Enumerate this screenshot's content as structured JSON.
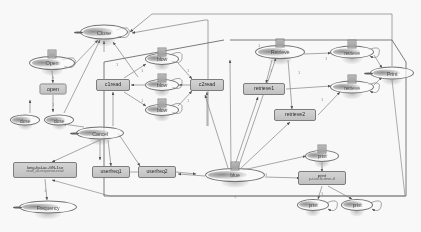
{
  "diagram": {
    "background": "#fdfdfd",
    "node_fill_box": "#cccccc",
    "node_stroke": "#6e6e6e",
    "edge_color": "#7d7d7d",
    "frame_color": "#5f5f5f"
  },
  "nodes": [
    {
      "id": "close_top",
      "label": "Close",
      "shape": "ellipse",
      "dot": true,
      "x": 104,
      "y": 32,
      "w": 48,
      "h": 15,
      "fs": 6.0
    },
    {
      "id": "open_ell",
      "label": "Open",
      "shape": "ellipse",
      "dot": false,
      "x": 52,
      "y": 63,
      "w": 46,
      "h": 14,
      "fs": 5.6
    },
    {
      "id": "open_box",
      "label": "open",
      "shape": "box",
      "x": 53,
      "y": 89,
      "w": 27,
      "h": 11,
      "fs": 5.4
    },
    {
      "id": "close_ell1",
      "label": "close",
      "shape": "ellipse",
      "dot": false,
      "x": 25,
      "y": 120,
      "w": 30,
      "h": 11,
      "fs": 5.0
    },
    {
      "id": "close_ell2",
      "label": "close",
      "shape": "ellipse",
      "dot": false,
      "x": 59,
      "y": 120,
      "w": 30,
      "h": 11,
      "fs": 5.0
    },
    {
      "id": "c1read",
      "label": "c1read",
      "shape": "box",
      "x": 113,
      "y": 85,
      "w": 34,
      "h": 12,
      "fs": 5.4
    },
    {
      "id": "blow_top",
      "label": "blow",
      "shape": "ellipse",
      "dot": false,
      "x": 162,
      "y": 59,
      "w": 34,
      "h": 12,
      "fs": 5.2
    },
    {
      "id": "blow_mid",
      "label": "blow",
      "shape": "ellipse",
      "dot": false,
      "x": 162,
      "y": 85,
      "w": 34,
      "h": 12,
      "fs": 5.2
    },
    {
      "id": "blow_bot",
      "label": "blow",
      "shape": "ellipse",
      "dot": false,
      "x": 162,
      "y": 110,
      "w": 34,
      "h": 12,
      "fs": 5.2
    },
    {
      "id": "c2read",
      "label": "c2read",
      "shape": "box",
      "x": 207,
      "y": 85,
      "w": 34,
      "h": 12,
      "fs": 5.4
    },
    {
      "id": "cancel_hub",
      "label": "Cancel",
      "shape": "ellipse",
      "dot": true,
      "x": 100,
      "y": 133,
      "w": 48,
      "h": 13,
      "fs": 5.4
    },
    {
      "id": "retrieve_e",
      "label": "Retrieve",
      "shape": "ellipse",
      "dot": false,
      "x": 280,
      "y": 52,
      "w": 50,
      "h": 14,
      "fs": 5.4
    },
    {
      "id": "retrieve1",
      "label": "retrieve1",
      "shape": "box",
      "x": 264,
      "y": 89,
      "w": 42,
      "h": 12,
      "fs": 5.2
    },
    {
      "id": "retrieve2",
      "label": "retrieve2",
      "shape": "box",
      "x": 295,
      "y": 115,
      "w": 42,
      "h": 12,
      "fs": 5.2
    },
    {
      "id": "retrieve_r1",
      "label": "retrieve",
      "shape": "ellipse",
      "dot": false,
      "x": 352,
      "y": 52,
      "w": 44,
      "h": 13,
      "fs": 5.2
    },
    {
      "id": "retrieve_r2",
      "label": "retrieve",
      "shape": "ellipse",
      "dot": false,
      "x": 352,
      "y": 87,
      "w": 44,
      "h": 13,
      "fs": 5.2
    },
    {
      "id": "print_ell",
      "label": "Print",
      "shape": "ellipse",
      "dot": true,
      "x": 392,
      "y": 73,
      "w": 44,
      "h": 13,
      "fs": 5.6
    },
    {
      "id": "blue_hub",
      "label": "blue",
      "shape": "ellipse",
      "dot": false,
      "x": 235,
      "y": 175,
      "w": 60,
      "h": 14,
      "fs": 5.4
    },
    {
      "id": "getfreq_box",
      "label": "long-hal-ac-GN-1se",
      "label2": "read_all-response-read",
      "shape": "box",
      "x": 45,
      "y": 170,
      "w": 64,
      "h": 16,
      "fs": 4.2
    },
    {
      "id": "frequency",
      "label": "Frequency",
      "shape": "ellipse",
      "dot": true,
      "x": 48,
      "y": 207,
      "w": 58,
      "h": 13,
      "fs": 5.2
    },
    {
      "id": "usefreq1",
      "label": "userfreq1",
      "shape": "box",
      "x": 111,
      "y": 172,
      "w": 38,
      "h": 12,
      "fs": 5.0
    },
    {
      "id": "usefreq2",
      "label": "userfreq2",
      "shape": "box",
      "x": 157,
      "y": 172,
      "w": 38,
      "h": 12,
      "fs": 5.0
    },
    {
      "id": "print_up",
      "label": "print",
      "shape": "ellipse",
      "dot": false,
      "x": 322,
      "y": 156,
      "w": 34,
      "h": 12,
      "fs": 5.0
    },
    {
      "id": "print_box",
      "label": "print",
      "label2": "p-t-raf-fit-timer-tf",
      "shape": "box",
      "x": 322,
      "y": 178,
      "w": 48,
      "h": 14,
      "fs": 4.4
    },
    {
      "id": "print_d1",
      "label": "print",
      "shape": "ellipse",
      "dot": false,
      "x": 313,
      "y": 205,
      "w": 32,
      "h": 12,
      "fs": 5.0
    },
    {
      "id": "print_d2",
      "label": "print",
      "shape": "ellipse",
      "dot": false,
      "x": 357,
      "y": 205,
      "w": 32,
      "h": 12,
      "fs": 5.0
    }
  ],
  "edge_labels": [
    {
      "text": "1",
      "x": 53,
      "y": 77
    },
    {
      "text": "1",
      "x": 53,
      "y": 104
    },
    {
      "text": "1",
      "x": 117,
      "y": 64
    },
    {
      "text": "1",
      "x": 142,
      "y": 70
    },
    {
      "text": "1",
      "x": 188,
      "y": 70
    },
    {
      "text": "1",
      "x": 142,
      "y": 100
    },
    {
      "text": "1",
      "x": 188,
      "y": 100
    },
    {
      "text": "1",
      "x": 259,
      "y": 45
    },
    {
      "text": "1",
      "x": 271,
      "y": 70
    },
    {
      "text": "1",
      "x": 299,
      "y": 72
    },
    {
      "text": "1",
      "x": 326,
      "y": 58
    },
    {
      "text": "1",
      "x": 322,
      "y": 99
    },
    {
      "text": "1",
      "x": 322,
      "y": 168
    },
    {
      "text": "1",
      "x": 322,
      "y": 193
    },
    {
      "text": "1",
      "x": 45,
      "y": 190
    },
    {
      "text": "1",
      "x": 235,
      "y": 196
    },
    {
      "text": "1",
      "x": 266,
      "y": 174
    }
  ],
  "frames": [
    {
      "name": "right-group",
      "x": 99,
      "y": 28,
      "w": 307,
      "h": 179
    }
  ]
}
